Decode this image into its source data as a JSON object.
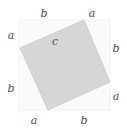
{
  "figure": {
    "kind": "pythagorean-theorem-square-diagram",
    "width": 127,
    "height": 132,
    "background_color": "#ffffff",
    "outer_square": {
      "name": "outer-square",
      "fill_color": "#fafafa",
      "stroke_color": "#f0f0f0",
      "x": 19,
      "y": 20,
      "width": 91,
      "height": 90
    },
    "inner_square": {
      "name": "inner-tilted-square",
      "fill_color": "#d6d6d6",
      "stroke_color": "#cccccc",
      "points": "84,20 110,82 48,110 20,48"
    },
    "labels": [
      {
        "id": "top-left",
        "text": "b",
        "x": 44,
        "y": 13
      },
      {
        "id": "top-right",
        "text": "a",
        "x": 92,
        "y": 13
      },
      {
        "id": "left-top",
        "text": "a",
        "x": 11,
        "y": 35
      },
      {
        "id": "left-bottom",
        "text": "b",
        "x": 11,
        "y": 88
      },
      {
        "id": "right-top",
        "text": "b",
        "x": 116,
        "y": 48
      },
      {
        "id": "right-bottom",
        "text": "a",
        "x": 116,
        "y": 96
      },
      {
        "id": "bottom-left",
        "text": "a",
        "x": 34,
        "y": 120
      },
      {
        "id": "bottom-right",
        "text": "b",
        "x": 84,
        "y": 120
      },
      {
        "id": "hypotenuse",
        "text": "c",
        "x": 55,
        "y": 41
      }
    ]
  }
}
